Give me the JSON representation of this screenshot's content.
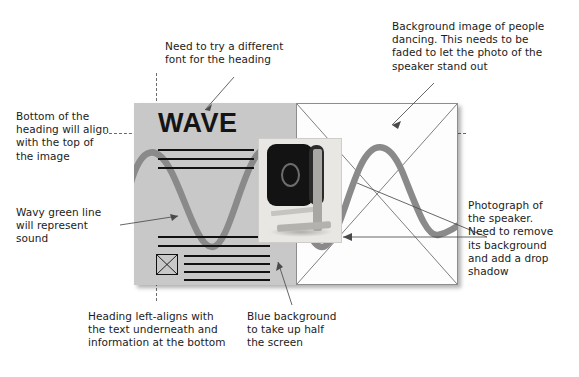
{
  "document": {
    "kind": "design-annotation-wireframe",
    "title": "WAVE speaker landing page wireframe with annotations"
  },
  "mockup": {
    "heading": "WAVE",
    "left_panel_color": "#c8c8c8",
    "right_panel_color": "#fdfdfd",
    "wave_line_color": "#8a8a8a",
    "text_rule_color": "#111111",
    "top_rules": 3,
    "bottom_rules_top_group": 2,
    "bottom_rules_lower_group": 4,
    "image_placeholder_label": "crossed-box-image-placeholder",
    "speaker_photo_label": "speaker-product-photo"
  },
  "annotations": [
    {
      "id": "heading-font",
      "text": "Need to try a different\nfont for the heading"
    },
    {
      "id": "background-image",
      "text": "Background image of people\ndancing. This needs to be\nfaded to let the photo of the\nspeaker stand out"
    },
    {
      "id": "heading-align",
      "text": "Bottom of the\nheading will align\nwith the top of\nthe image"
    },
    {
      "id": "wavy-line",
      "text": "Wavy green line\nwill represent\nsound"
    },
    {
      "id": "photograph",
      "text": "Photograph of\nthe speaker.\nNeed to remove\nits background\nand add a drop\nshadow"
    },
    {
      "id": "heading-left-align",
      "text": "Heading left-aligns with\nthe text underneath and\ninformation at the bottom"
    },
    {
      "id": "blue-background",
      "text": "Blue background\nto take up half\nthe screen"
    }
  ],
  "guides": {
    "horizontal_label": "heading-baseline-guide",
    "vertical_label": "left-alignment-guide",
    "color": "#6b6b6b",
    "style": "dashed"
  }
}
